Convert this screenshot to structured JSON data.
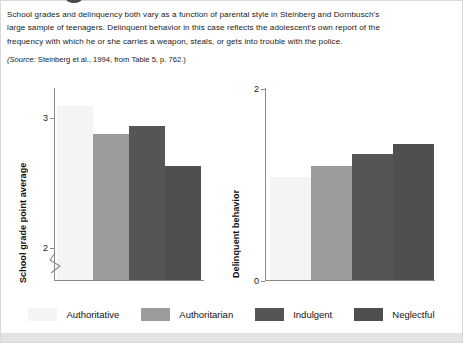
{
  "caption": {
    "lines": [
      "School grades and delinquency both vary as a function of parental style in Steinberg and Dornbusch's",
      "large sample of teenagers. Delinquent behavior in this case reflects the adolescent's own report of the",
      "frequency with which he or she carries a weapon, steals, or gets into trouble with the police."
    ],
    "source_prefix": "(Source:",
    "source_rest": " Steinberg et al., 1994, from Table 5, p. 762.)"
  },
  "legend": {
    "items": [
      {
        "label": "Authoritative",
        "color": "#f4f4f2"
      },
      {
        "label": "Authoritarian",
        "color": "#9c9c9c"
      },
      {
        "label": "Indulgent",
        "color": "#555555"
      },
      {
        "label": "Neglectful",
        "color": "#4f4f4f"
      }
    ]
  },
  "chart_data": [
    {
      "type": "bar",
      "id": "school-grades",
      "title": "",
      "xlabel": "",
      "ylabel": "School grade point average",
      "categories": [
        "Authoritative",
        "Authoritarian",
        "Indulgent",
        "Neglectful"
      ],
      "values": [
        3.08,
        2.87,
        2.93,
        2.62
      ],
      "colors": [
        "#f4f4f2",
        "#9c9c9c",
        "#555555",
        "#4f4f4f"
      ],
      "ylim": [
        1.75,
        3.22
      ],
      "yticks": [
        2,
        3
      ],
      "ytick_labels": [
        "2",
        "3"
      ],
      "axis_break": true,
      "grid": false,
      "legend_position": "bottom"
    },
    {
      "type": "bar",
      "id": "delinquent-behavior",
      "title": "",
      "xlabel": "",
      "ylabel": "Delinquent behavior",
      "categories": [
        "Authoritative",
        "Authoritarian",
        "Indulgent",
        "Neglectful"
      ],
      "values": [
        1.07,
        1.19,
        1.31,
        1.42
      ],
      "colors": [
        "#f4f4f2",
        "#9c9c9c",
        "#555555",
        "#4f4f4f"
      ],
      "ylim": [
        0,
        2
      ],
      "yticks": [
        0,
        2
      ],
      "ytick_labels": [
        "0",
        "2"
      ],
      "axis_break": false,
      "grid": false,
      "legend_position": "bottom"
    }
  ]
}
